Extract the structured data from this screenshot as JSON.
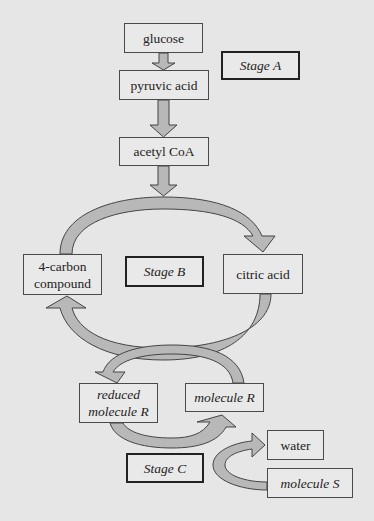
{
  "diagram": {
    "colors": {
      "background": "#e6e6e6",
      "arrow_fill": "#b8b8b8",
      "arrow_stroke": "#444444",
      "box_border": "#4a4a4a",
      "stage_border": "#222222"
    },
    "nodes": {
      "glucose": "glucose",
      "pyruvic_acid": "pyruvic acid",
      "acetyl_coa": "acetyl CoA",
      "four_carbon_line1": "4-carbon",
      "four_carbon_line2": "compound",
      "citric_acid": "citric acid",
      "reduced_r_line1": "reduced",
      "reduced_r_line2": "molecule R",
      "molecule_r": "molecule R",
      "water": "water",
      "molecule_s": "molecule S"
    },
    "stages": {
      "a": "Stage A",
      "b": "Stage B",
      "c": "Stage C"
    },
    "edges": [
      {
        "from": "glucose",
        "to": "pyruvic acid"
      },
      {
        "from": "pyruvic acid",
        "to": "acetyl CoA"
      },
      {
        "from": "acetyl CoA",
        "to": "Stage B cycle"
      },
      {
        "from": "4-carbon compound",
        "to": "citric acid"
      },
      {
        "from": "citric acid",
        "to": "4-carbon compound"
      },
      {
        "from": "molecule R",
        "to": "reduced molecule R"
      },
      {
        "from": "reduced molecule R",
        "to": "molecule R"
      },
      {
        "from": "molecule S",
        "to": "water"
      }
    ]
  }
}
